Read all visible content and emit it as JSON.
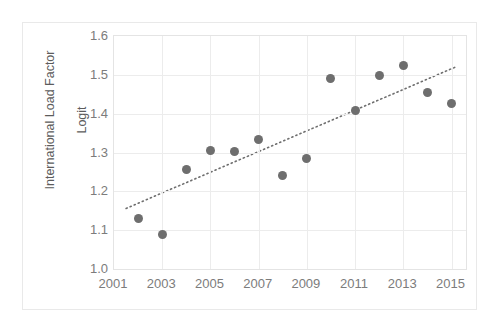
{
  "figure": {
    "cropped_title_fragment": "",
    "background_color": "#ffffff",
    "frame_color": "#e9e9e9"
  },
  "axes": {
    "y_title": "International Load Factor\nLogit",
    "y_title_line1": "International Load Factor",
    "y_title_line2": "Logit",
    "x_title": "",
    "marker_color": "#6e6e6e",
    "gridline_color": "#ececec",
    "tick_label_color": "#7c7c7c",
    "trendline_color": "#6e6e6e"
  },
  "chart_data": {
    "type": "scatter",
    "title": "",
    "xlabel": "",
    "ylabel": "International Load Factor Logit",
    "xlim": [
      2001,
      2015.6
    ],
    "ylim": [
      1.0,
      1.6
    ],
    "grid": true,
    "legend": "none",
    "x_ticks": [
      2001,
      2003,
      2005,
      2007,
      2009,
      2011,
      2013,
      2015
    ],
    "x_tick_labels": [
      "2001",
      "2003",
      "2005",
      "2007",
      "2009",
      "2011",
      "2013",
      "2015"
    ],
    "y_ticks": [
      1.0,
      1.1,
      1.2,
      1.3,
      1.4,
      1.5,
      1.6
    ],
    "y_tick_labels": [
      "1.0",
      "1.1",
      "1.2",
      "1.3",
      "1.4",
      "1.5",
      "1.6"
    ],
    "x": [
      2002,
      2003,
      2004,
      2005,
      2006,
      2007,
      2008,
      2009,
      2010,
      2011,
      2012,
      2013,
      2014,
      2015
    ],
    "values": [
      1.13,
      1.09,
      1.255,
      1.306,
      1.303,
      1.334,
      1.241,
      1.285,
      1.49,
      1.407,
      1.497,
      1.525,
      1.455,
      1.427
    ],
    "series": [
      {
        "name": "International Load Factor Logit",
        "points": [
          {
            "x": 2002,
            "y": 1.13
          },
          {
            "x": 2003,
            "y": 1.09
          },
          {
            "x": 2004,
            "y": 1.255
          },
          {
            "x": 2005,
            "y": 1.306
          },
          {
            "x": 2006,
            "y": 1.303
          },
          {
            "x": 2007,
            "y": 1.334
          },
          {
            "x": 2008,
            "y": 1.241
          },
          {
            "x": 2009,
            "y": 1.285
          },
          {
            "x": 2010,
            "y": 1.49
          },
          {
            "x": 2011,
            "y": 1.407
          },
          {
            "x": 2012,
            "y": 1.497
          },
          {
            "x": 2013,
            "y": 1.525
          },
          {
            "x": 2014,
            "y": 1.455
          },
          {
            "x": 2015,
            "y": 1.427
          }
        ]
      }
    ],
    "trendline": {
      "style": "dotted",
      "x_start": 2001.5,
      "y_start": 1.156,
      "x_end": 2015.2,
      "y_end": 1.521
    }
  }
}
